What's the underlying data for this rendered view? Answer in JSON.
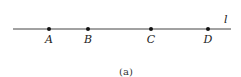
{
  "diagram": {
    "line_label": "l",
    "line": {
      "x1": 13,
      "x2": 231,
      "y": 29,
      "color": "#444444"
    },
    "points": [
      {
        "label": "A",
        "x": 49
      },
      {
        "label": "B",
        "x": 88
      },
      {
        "label": "C",
        "x": 151
      },
      {
        "label": "D",
        "x": 208
      }
    ],
    "caption": "(a)"
  }
}
